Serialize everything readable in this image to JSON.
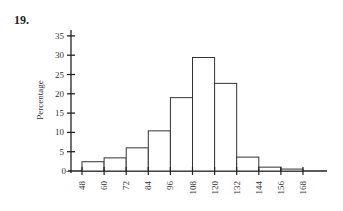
{
  "question_number": "19.",
  "chart_data": {
    "type": "bar",
    "title": "",
    "xlabel": "",
    "ylabel": "Percentage",
    "bin_edges": [
      48,
      60,
      72,
      84,
      96,
      108,
      120,
      132,
      144,
      156,
      168
    ],
    "categories": [
      "48-60",
      "60-72",
      "72-84",
      "84-96",
      "96-108",
      "108-120",
      "120-132",
      "132-144",
      "144-156",
      "156-168"
    ],
    "values": [
      2.4,
      3.4,
      6.0,
      10.4,
      19.0,
      29.4,
      22.7,
      3.6,
      1.0,
      0.5
    ],
    "yticks": [
      0,
      5,
      10,
      15,
      20,
      25,
      30,
      35
    ],
    "xticks": [
      48,
      60,
      72,
      84,
      96,
      108,
      120,
      132,
      144,
      156,
      168
    ],
    "ylim": [
      0,
      37
    ],
    "grid": false,
    "legend": null
  }
}
